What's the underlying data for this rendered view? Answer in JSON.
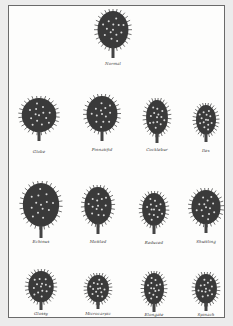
{
  "plate": {
    "title": "",
    "specimens": [
      {
        "name": "Normal",
        "x": 112,
        "y": 8,
        "w": 34,
        "h": 48,
        "label_y": 60
      },
      {
        "name": "Globe",
        "x": 38,
        "y": 95,
        "w": 38,
        "h": 44,
        "label_y": 148
      },
      {
        "name": "Pinnatifid",
        "x": 101,
        "y": 93,
        "w": 34,
        "h": 46,
        "label_y": 146
      },
      {
        "name": "Cocklebur",
        "x": 156,
        "y": 97,
        "w": 24,
        "h": 44,
        "label_y": 146
      },
      {
        "name": "Ilex",
        "x": 205,
        "y": 102,
        "w": 22,
        "h": 38,
        "label_y": 147
      },
      {
        "name": "Echinus",
        "x": 40,
        "y": 180,
        "w": 40,
        "h": 56,
        "label_y": 238
      },
      {
        "name": "Mottled",
        "x": 97,
        "y": 184,
        "w": 30,
        "h": 48,
        "label_y": 238
      },
      {
        "name": "Reduced",
        "x": 153,
        "y": 190,
        "w": 26,
        "h": 42,
        "label_y": 239
      },
      {
        "name": "Shuttling",
        "x": 205,
        "y": 187,
        "w": 32,
        "h": 44,
        "label_y": 238
      },
      {
        "name": "Glossy",
        "x": 40,
        "y": 268,
        "w": 28,
        "h": 40,
        "label_y": 310
      },
      {
        "name": "Microcarpic",
        "x": 97,
        "y": 272,
        "w": 24,
        "h": 35,
        "label_y": 310
      },
      {
        "name": "Elongate",
        "x": 153,
        "y": 270,
        "w": 22,
        "h": 40,
        "label_y": 311
      },
      {
        "name": "Spinach",
        "x": 205,
        "y": 271,
        "w": 24,
        "h": 38,
        "label_y": 311
      }
    ]
  },
  "colors": {
    "background": "#ececec",
    "paper": "#fdfdfc",
    "ink": "#2a2a2a",
    "frame": "#6a6a6a"
  }
}
